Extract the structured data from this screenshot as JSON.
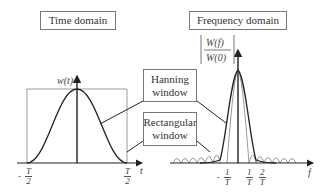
{
  "time_domain": {
    "title": "Time domain",
    "y_label": "w(t)",
    "x_label": "t",
    "ticks": [
      {
        "sign": "-",
        "num": "T",
        "den": "2"
      },
      {
        "sign": "",
        "num": "T",
        "den": "2"
      }
    ]
  },
  "frequency_domain": {
    "title": "Frequency domain",
    "y_label_num": "W(f)",
    "y_label_den": "W(0)",
    "x_label": "f",
    "ticks": [
      {
        "sign": "-",
        "num": "1",
        "den": "T"
      },
      {
        "sign": "",
        "num": "1",
        "den": "T"
      },
      {
        "sign": "",
        "num": "2",
        "den": "T"
      }
    ]
  },
  "callouts": {
    "hanning": {
      "line1": "Hanning",
      "line2": "window"
    },
    "rectangular": {
      "line1": "Rectangular",
      "line2": "window"
    }
  },
  "colors": {
    "hanning_curve": "#222222",
    "rectangular_curve": "#9a9a9a",
    "axis": "#222222",
    "box_border": "#777777"
  }
}
